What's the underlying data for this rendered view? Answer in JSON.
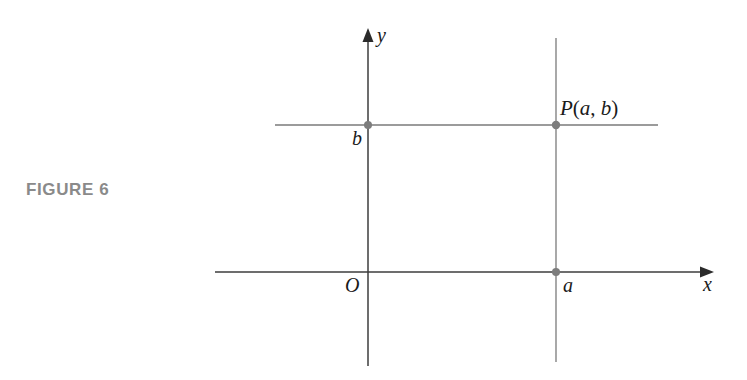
{
  "figure": {
    "caption": "FIGURE 6",
    "caption_color": "#8a8a8a",
    "background_color": "#ffffff"
  },
  "diagram": {
    "type": "coordinate-plane",
    "axes": {
      "x_label": "x",
      "y_label": "y",
      "origin_label": "O",
      "axis_color": "#444444",
      "x_axis": {
        "x1": 215,
        "x2": 712,
        "y": 272,
        "arrow": "right"
      },
      "y_axis": {
        "x": 368,
        "y1": 31,
        "y2": 366,
        "arrow": "up"
      }
    },
    "point": {
      "label_P": "P",
      "label_open_paren": "(",
      "label_a": "a",
      "label_comma": ", ",
      "label_b": "b",
      "label_close_paren": ")",
      "full_label": "P(a, b)",
      "x": 556,
      "y": 125,
      "marker_color": "#7d7d7d",
      "marker_radius": 4
    },
    "coordinates": {
      "a_label": "a",
      "b_label": "b",
      "a_value_x": 556,
      "b_value_y": 125
    },
    "guide_lines": {
      "color": "#7a7a7a",
      "horizontal": {
        "x1": 275,
        "x2": 658,
        "y": 125
      },
      "vertical": {
        "x": 556,
        "y1": 38,
        "y2": 362
      }
    },
    "markers": [
      {
        "name": "point-on-y-axis-b",
        "x": 368,
        "y": 125
      },
      {
        "name": "point-on-x-axis-a",
        "x": 556,
        "y": 272
      },
      {
        "name": "point-P",
        "x": 556,
        "y": 125
      }
    ]
  }
}
